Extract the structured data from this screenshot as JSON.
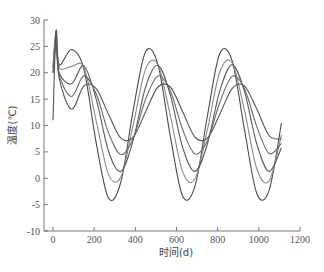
{
  "chart_data": {
    "type": "line",
    "title": "",
    "xlabel": "时间(d)",
    "ylabel": "温度(℃)",
    "xlim": [
      0,
      1200
    ],
    "ylim": [
      -10,
      30
    ],
    "xticks": [
      0,
      200,
      400,
      600,
      800,
      1000,
      1200
    ],
    "yticks": [
      -10,
      -5,
      0,
      5,
      10,
      15,
      20,
      25,
      30
    ],
    "grid": false,
    "legend": "none",
    "x": [
      0,
      15,
      30,
      90,
      150,
      210,
      270,
      330,
      390,
      450,
      510,
      570,
      630,
      690,
      750,
      810,
      870,
      930,
      990,
      1050,
      1110
    ],
    "series": [
      {
        "name": "curve-1",
        "color": "#4a4a4a",
        "values": [
          21,
          28,
          21.5,
          24.4,
          20.7,
          6.7,
          -3.8,
          -0.7,
          13.0,
          24.0,
          21.5,
          8.0,
          -3.4,
          -1.5,
          11.8,
          23.6,
          22.3,
          9.3,
          -2.9,
          -2.3,
          10.5
        ]
      },
      {
        "name": "curve-2",
        "color": "#8a8a8a",
        "values": [
          21,
          27,
          21.0,
          21.2,
          21.0,
          10.9,
          0.7,
          0.3,
          10.2,
          20.7,
          21.5,
          11.9,
          1.2,
          -0.1,
          9.2,
          20.1,
          21.9,
          12.9,
          1.8,
          -0.5,
          8.2
        ]
      },
      {
        "name": "curve-3",
        "color": "#5a5a5a",
        "values": [
          20,
          26,
          20.0,
          17.9,
          21.3,
          15.0,
          5.1,
          1.3,
          7.3,
          17.3,
          21.4,
          15.8,
          5.8,
          1.3,
          6.5,
          16.5,
          21.5,
          16.5,
          6.5,
          1.3,
          5.8
        ]
      },
      {
        "name": "curve-4",
        "color": "#6a6a6a",
        "values": [
          20,
          25,
          19.5,
          15.5,
          19.4,
          16.0,
          8.6,
          4.5,
          7.6,
          15.0,
          19.4,
          16.6,
          9.2,
          4.6,
          7.1,
          14.3,
          19.3,
          17.0,
          9.8,
          4.7,
          6.6
        ]
      },
      {
        "name": "curve-5",
        "color": "#555555",
        "values": [
          11,
          28,
          19.0,
          13.1,
          17.5,
          17.0,
          12.1,
          7.6,
          7.8,
          12.6,
          17.3,
          17.3,
          12.6,
          7.8,
          7.6,
          12.1,
          17.0,
          17.5,
          13.1,
          8.1,
          7.4
        ]
      }
    ]
  }
}
